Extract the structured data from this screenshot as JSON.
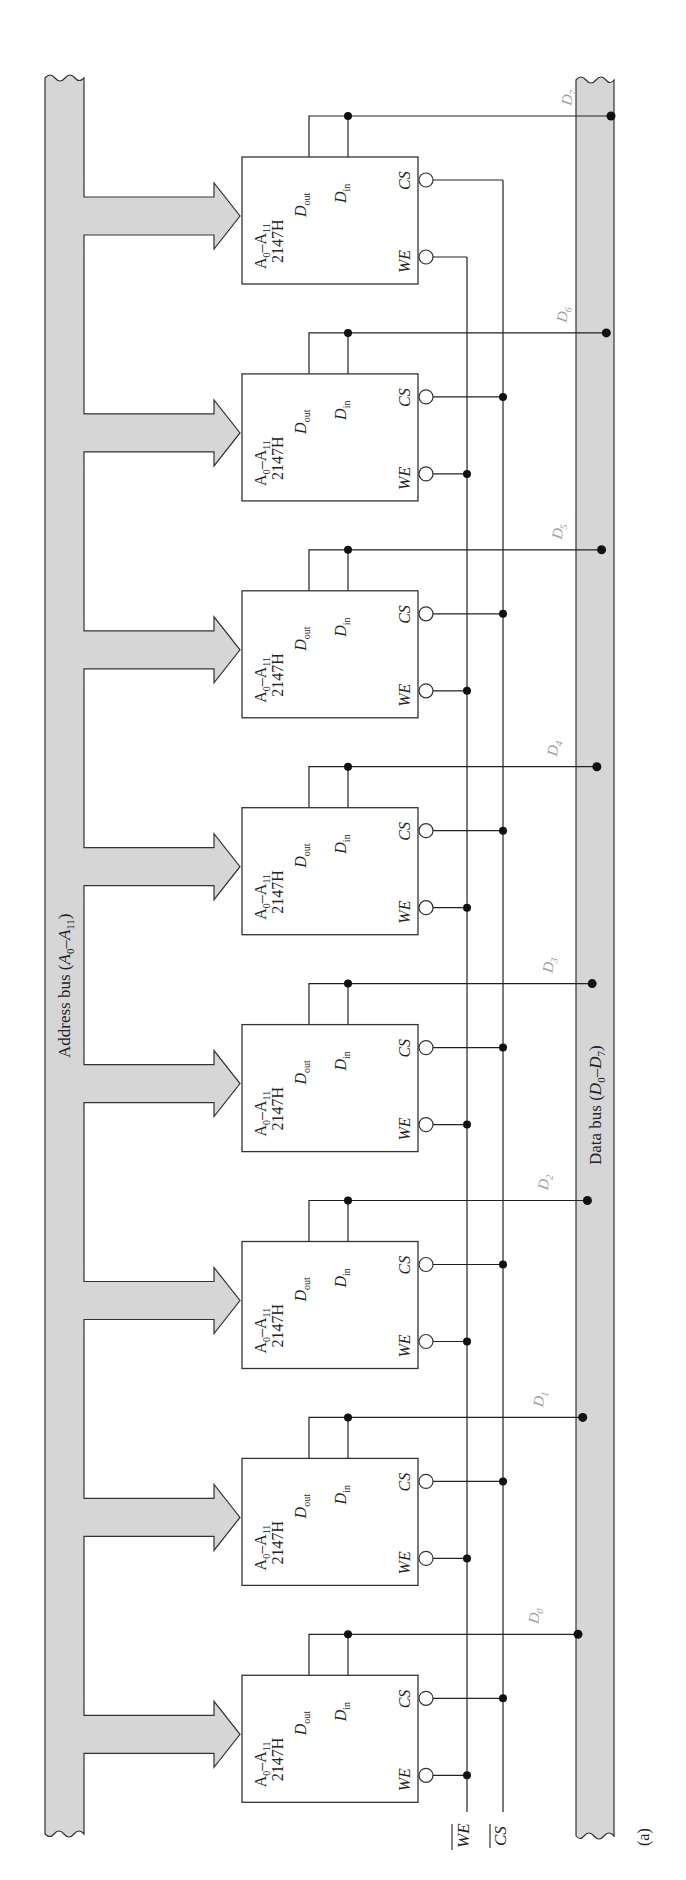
{
  "figure": {
    "caption": "(a)",
    "address_bus": {
      "label_main": "Address bus (",
      "label_a": "A",
      "label_sub0": "0",
      "label_dash": "–",
      "label_sub11": "11",
      "label_close": ")",
      "full_label": "Address bus (A0–A11)"
    },
    "data_bus": {
      "label_main": "Data bus (",
      "label_d": "D",
      "label_sub0": "0",
      "label_dash": "–",
      "label_sub7": "7",
      "label_close": ")",
      "full_label": "Data bus (D0–D7)"
    },
    "control_lines": {
      "we_bar": "WE",
      "cs_bar": "CS"
    },
    "chip_template": {
      "part_number": "2147H",
      "address_label": "A0–A11",
      "dout_label": "D",
      "dout_sub": "out",
      "din_label": "D",
      "din_sub": "in",
      "cs_label": "CS",
      "we_label": "WE"
    },
    "chips": [
      {
        "index": 0,
        "data_line": "D",
        "data_sub": "7"
      },
      {
        "index": 1,
        "data_line": "D",
        "data_sub": "6"
      },
      {
        "index": 2,
        "data_line": "D",
        "data_sub": "5"
      },
      {
        "index": 3,
        "data_line": "D",
        "data_sub": "4"
      },
      {
        "index": 4,
        "data_line": "D",
        "data_sub": "3"
      },
      {
        "index": 5,
        "data_line": "D",
        "data_sub": "2"
      },
      {
        "index": 6,
        "data_line": "D",
        "data_sub": "1"
      },
      {
        "index": 7,
        "data_line": "D",
        "data_sub": "0"
      }
    ],
    "colors": {
      "bus_fill": "#d6d6d6",
      "line": "#222222",
      "data_label_gray": "#a0a0a0"
    }
  }
}
